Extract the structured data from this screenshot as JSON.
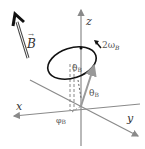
{
  "diagram": {
    "labels": {
      "field": "B",
      "field_arrow_mark": "→",
      "z_axis": "z",
      "x_axis": "x",
      "y_axis": "y",
      "precession_rate": "2ω",
      "precession_rate_sub": "B",
      "theta": "θ",
      "theta_sub": "B",
      "theta_inner": "θ",
      "theta_inner_sub": "B",
      "phi": "φ",
      "phi_sub": "B"
    },
    "colors": {
      "axes": "#8a8a8a",
      "field_arrow": "#111111",
      "orbit": "#111111",
      "vector": "#9a9a9a",
      "text": "#333333"
    }
  }
}
